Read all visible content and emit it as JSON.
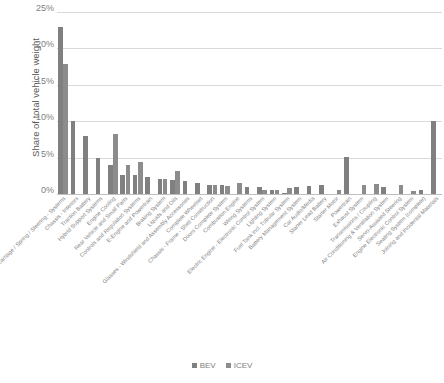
{
  "chart_data": {
    "type": "bar",
    "title": "",
    "xlabel": "",
    "ylabel": "Share of total vehicle weight",
    "ylim": [
      0,
      25
    ],
    "ytick_labels": [
      "0%",
      "5%",
      "10%",
      "15%",
      "20%",
      "25%"
    ],
    "ytick_values": [
      0,
      5,
      10,
      15,
      20,
      25
    ],
    "grid": true,
    "legend_position": "bottom",
    "categories": [
      "Undercarriage / Spring / Steering - Systems",
      "Chassis - Interiors",
      "Traction Battery",
      "Hybrid Support Systems",
      "Engine Cooling",
      "Rear Vehicle and Small Parts",
      "Controls and Regulation Systems",
      "E-Engine and Powertrain",
      "Braking System",
      "Liquids and Oils",
      "Glasses - Windshield and Assembly Accessories",
      "Complete Wheelset",
      "Chassis - Frame - Shell Construction",
      "Doors Complete System",
      "Combustion Engine",
      "Wiring Systems",
      "Electric Engine - Electronic Control System",
      "Lighting System",
      "Fuel Tank incl. Tubular System",
      "Battery Management System",
      "Car Audio/Media",
      "Starter Lead Battery",
      "Starter Motor",
      "Powertrain",
      "Exhaust System",
      "Transmissions / Coupling",
      "Air Conditioning & Ventilation System",
      "Servo-Assisted Steering",
      "Engine Electronic Control System",
      "Seating System (complete)",
      "Joining and Incidental Materials"
    ],
    "series": [
      {
        "name": "BEV",
        "values": [
          23.0,
          10.0,
          8.0,
          4.9,
          4.0,
          2.6,
          2.6,
          2.3,
          2.1,
          1.9,
          1.8,
          1.5,
          1.2,
          1.2,
          0.0,
          0.9,
          0.9,
          0.5,
          0.2,
          0.9,
          1.1,
          1.2,
          0.0,
          5.1,
          0.0,
          0.0,
          1.0,
          0.0,
          0.0,
          0.5,
          10.0
        ]
      },
      {
        "name": "ICEV",
        "values": [
          17.9,
          0.0,
          0.0,
          0.0,
          8.2,
          4.0,
          4.4,
          0.0,
          2.1,
          3.2,
          0.0,
          0.0,
          1.2,
          1.1,
          1.5,
          0.0,
          0.6,
          0.5,
          0.8,
          0.0,
          0.0,
          0.0,
          0.5,
          0.0,
          1.3,
          1.4,
          0.0,
          1.2,
          0.4,
          0.0,
          0.0
        ]
      }
    ],
    "colors": {
      "bev": "#808080",
      "icev": "#8c8c8c",
      "gridline": "#d9d9d9",
      "axis": "#bfbfbf",
      "text": "#808080",
      "axis_title": "#595959"
    }
  }
}
